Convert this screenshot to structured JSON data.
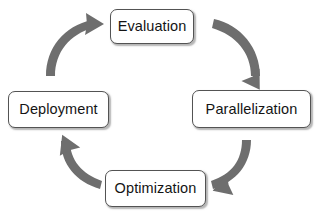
{
  "diagram": {
    "direction": "clockwise",
    "background_color": "#ffffff",
    "box_border_color": "#535353",
    "box_fill_color": "#ffffff",
    "text_color": "#141414",
    "arrow_color": "#6e6e6e",
    "nodes": [
      {
        "id": "evaluation",
        "label": "Evaluation",
        "position": "top"
      },
      {
        "id": "parallelization",
        "label": "Parallelization",
        "position": "right"
      },
      {
        "id": "optimization",
        "label": "Optimization",
        "position": "bottom"
      },
      {
        "id": "deployment",
        "label": "Deployment",
        "position": "left"
      }
    ],
    "arrows": [
      {
        "id": "arrow-evaluation-to-parallelization",
        "from": "Evaluation",
        "to": "Parallelization",
        "quadrant": "top-right"
      },
      {
        "id": "arrow-parallelization-to-optimization",
        "from": "Parallelization",
        "to": "Optimization",
        "quadrant": "bottom-right"
      },
      {
        "id": "arrow-optimization-to-deployment",
        "from": "Optimization",
        "to": "Deployment",
        "quadrant": "bottom-left"
      },
      {
        "id": "arrow-deployment-to-evaluation",
        "from": "Deployment",
        "to": "Evaluation",
        "quadrant": "top-left"
      }
    ]
  }
}
